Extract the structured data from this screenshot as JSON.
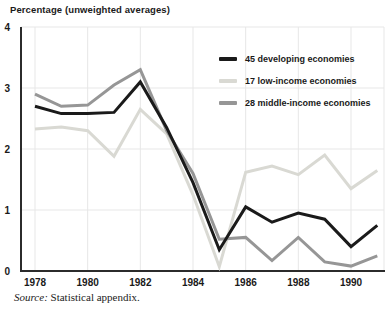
{
  "title": "Percentage (unweighted averages)",
  "source": {
    "label": "Source:",
    "text": " Statistical appendix."
  },
  "colors": {
    "axis": "#2b2b2b",
    "grid": "#e7e7e7",
    "text": "#1a1a1a"
  },
  "chart_data": {
    "type": "line",
    "title": "Percentage (unweighted averages)",
    "xlabel": "",
    "ylabel": "Percentage",
    "ylim": [
      0,
      4
    ],
    "grid": true,
    "legend_position": "top-right",
    "x": [
      1978,
      1979,
      1980,
      1981,
      1982,
      1983,
      1984,
      1985,
      1986,
      1987,
      1988,
      1989,
      1990,
      1991
    ],
    "x_ticks": [
      1978,
      1980,
      1982,
      1984,
      1986,
      1988,
      1990
    ],
    "x_tick_labels": [
      "1978",
      "1980",
      "1982",
      "1984",
      "1986",
      "1988",
      "1990"
    ],
    "y_ticks": [
      0,
      1,
      2,
      3,
      4
    ],
    "y_tick_labels": [
      "0",
      "1",
      "2",
      "3",
      "4"
    ],
    "series": [
      {
        "name": "45 developing economies",
        "color": "#1a1a1a",
        "values": [
          2.7,
          2.58,
          2.58,
          2.6,
          3.1,
          2.35,
          1.45,
          0.35,
          1.05,
          0.8,
          0.95,
          0.85,
          0.4,
          0.75
        ]
      },
      {
        "name": "17 low-income economies",
        "color": "#d9d9d3",
        "values": [
          2.33,
          2.36,
          2.3,
          1.88,
          2.65,
          2.25,
          1.25,
          0.07,
          1.62,
          1.72,
          1.58,
          1.9,
          1.35,
          1.65
        ]
      },
      {
        "name": "28 middle-income economies",
        "color": "#969696",
        "values": [
          2.9,
          2.7,
          2.72,
          3.05,
          3.3,
          2.3,
          1.6,
          0.52,
          0.55,
          0.17,
          0.55,
          0.15,
          0.08,
          0.25
        ]
      }
    ]
  }
}
